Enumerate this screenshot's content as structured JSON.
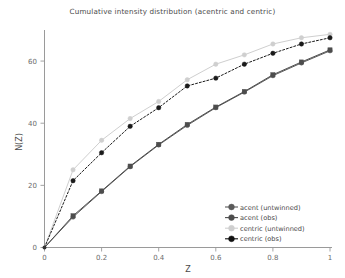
{
  "chart_data": {
    "type": "line",
    "title": "Cumulative intensity distribution (acentric and centric)",
    "xlabel": "Z",
    "ylabel": "N(Z)",
    "xlim": [
      0,
      1
    ],
    "ylim": [
      0,
      70
    ],
    "grid": false,
    "legend_position": "lower right",
    "xticks": [
      "0",
      "0.2",
      "0.4",
      "0.6",
      "0.8",
      "1"
    ],
    "xtick_values": [
      0,
      0.2,
      0.4,
      0.6,
      0.8,
      1
    ],
    "yticks": [
      "0",
      "20",
      "40",
      "60"
    ],
    "ytick_values": [
      0,
      20,
      40,
      60
    ],
    "x": [
      0,
      0.1,
      0.2,
      0.3,
      0.4,
      0.5,
      0.6,
      0.7,
      0.8,
      0.9,
      1.0
    ],
    "series": [
      {
        "name": "acent (untwinned)",
        "color": "#5a5a5a",
        "style": "solid",
        "marker": "circle",
        "values": [
          0,
          9.8,
          18.0,
          26.0,
          33.0,
          39.3,
          45.0,
          50.0,
          55.3,
          59.4,
          63.3
        ]
      },
      {
        "name": "acent (obs)",
        "color": "#4d4d4d",
        "style": "solid",
        "marker": "square",
        "values": [
          0,
          10.2,
          18.2,
          26.2,
          33.2,
          39.6,
          45.2,
          50.2,
          55.6,
          59.7,
          63.6
        ]
      },
      {
        "name": "centric (untwinned)",
        "color": "#cfcfcf",
        "style": "solid",
        "marker": "circle",
        "values": [
          0,
          25.0,
          34.5,
          41.5,
          47.0,
          54.0,
          59.0,
          62.0,
          65.5,
          67.5,
          68.6
        ]
      },
      {
        "name": "centric (obs)",
        "color": "#1a1a1a",
        "style": "dashed",
        "marker": "circle",
        "values": [
          0,
          21.5,
          30.5,
          39.0,
          45.0,
          52.0,
          54.5,
          59.0,
          62.5,
          65.5,
          67.5
        ]
      }
    ]
  },
  "legend": {
    "entries": [
      {
        "label": "acent (untwinned)",
        "swatch": "#5a5a5a"
      },
      {
        "label": "acent (obs)",
        "swatch": "#4d4d4d"
      },
      {
        "label": "centric (untwinned)",
        "swatch": "#cfcfcf"
      },
      {
        "label": "centric (obs)",
        "swatch": "#111111"
      }
    ]
  }
}
